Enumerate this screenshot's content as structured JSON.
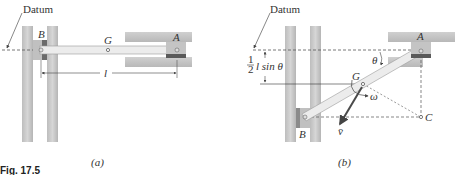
{
  "figure": {
    "caption": "Fig. 17.5",
    "panel_a": {
      "sublabel": "(a)",
      "datum_label": "Datum",
      "point_b": "B",
      "point_g": "G",
      "point_a": "A",
      "length_label": "l"
    },
    "panel_b": {
      "sublabel": "(b)",
      "datum_label": "Datum",
      "point_a": "A",
      "point_b": "B",
      "point_g": "G",
      "point_c": "C",
      "angle_label": "θ",
      "omega_label": "ω",
      "velocity_label": "v̄",
      "height_frac_num": "1",
      "height_frac_den": "2",
      "height_expr": "l sin θ"
    }
  },
  "colors": {
    "wall": "#c8c8c8",
    "wall_dark": "#a8a8a8",
    "rod": "#e6e6e6",
    "rod_edge": "#9a9a9a",
    "collar": "#b0b0b0",
    "collar_dark": "#5a5a5a",
    "dash": "#555555",
    "arrow": "#555555",
    "velocity": "#4a4a4a"
  }
}
